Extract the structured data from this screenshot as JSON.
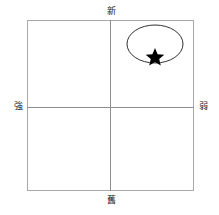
{
  "figure": {
    "type": "positioning-map",
    "title": "",
    "background_color": "#ffffff",
    "frame_color": "#a8a8a8",
    "axis_color": "#8e8e8e",
    "marker_color": "#000000"
  },
  "axes": {
    "vertical": {
      "top_label": "新",
      "bottom_label": "舊"
    },
    "horizontal": {
      "left_label": "強",
      "right_label": "弱"
    }
  },
  "plot_items": {
    "cluster_ellipse": {
      "name": "cluster-ellipse",
      "center_x": 155,
      "center_y": 44,
      "radius_x": 28,
      "radius_y": 19,
      "quadrant": "upper-right"
    },
    "star_marker": {
      "name": "star-marker",
      "x": 155,
      "y": 56,
      "quadrant": "upper-right"
    }
  }
}
